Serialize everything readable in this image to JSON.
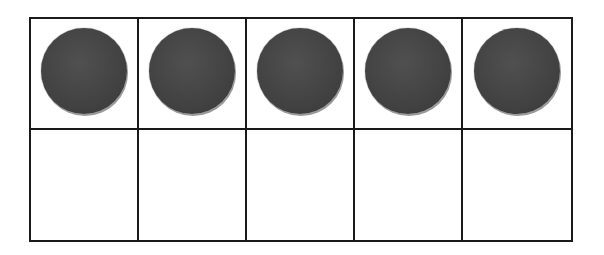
{
  "diagram": {
    "type": "ten-frame",
    "rows": 2,
    "columns": 5,
    "filled_count": 5,
    "cells": [
      {
        "row": 1,
        "col": 1,
        "counter": true
      },
      {
        "row": 1,
        "col": 2,
        "counter": true
      },
      {
        "row": 1,
        "col": 3,
        "counter": true
      },
      {
        "row": 1,
        "col": 4,
        "counter": true
      },
      {
        "row": 1,
        "col": 5,
        "counter": true
      },
      {
        "row": 2,
        "col": 1,
        "counter": false
      },
      {
        "row": 2,
        "col": 2,
        "counter": false
      },
      {
        "row": 2,
        "col": 3,
        "counter": false
      },
      {
        "row": 2,
        "col": 4,
        "counter": false
      },
      {
        "row": 2,
        "col": 5,
        "counter": false
      }
    ],
    "colors": {
      "grid_line": "#1a1a1a",
      "counter": "#444444",
      "background": "#ffffff"
    }
  }
}
